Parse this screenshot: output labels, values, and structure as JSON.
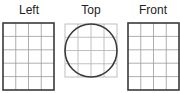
{
  "views": [
    {
      "label": "Left",
      "cols": 4,
      "rows": 5,
      "x": 3,
      "y": 23,
      "w": 51,
      "h": 67,
      "circle": false
    },
    {
      "label": "Top",
      "cols": 4,
      "rows": 4,
      "x": 65,
      "y": 24,
      "w": 52,
      "h": 53,
      "circle": true
    },
    {
      "label": "Front",
      "cols": 4,
      "rows": 5,
      "x": 128,
      "y": 23,
      "w": 51,
      "h": 67,
      "circle": false
    }
  ],
  "colors": {
    "outline": "#3a3a3a",
    "grid": "#9a9a9a",
    "top_grid": "#b0b0b0"
  }
}
